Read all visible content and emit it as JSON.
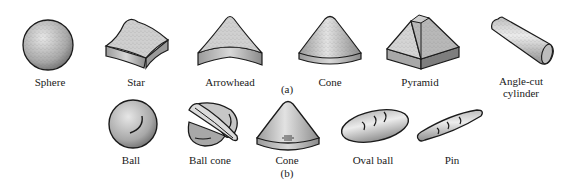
{
  "figure": {
    "row_a": {
      "caption": "(a)",
      "items": [
        {
          "name": "sphere",
          "label": "Sphere"
        },
        {
          "name": "star",
          "label": "Star"
        },
        {
          "name": "arrowhead",
          "label": "Arrowhead"
        },
        {
          "name": "cone",
          "label": "Cone"
        },
        {
          "name": "pyramid",
          "label": "Pyramid"
        },
        {
          "name": "angle-cut-cylinder",
          "label_line1": "Angle-cut",
          "label_line2": "cylinder"
        }
      ]
    },
    "row_b": {
      "caption": "(b)",
      "items": [
        {
          "name": "ball",
          "label": "Ball"
        },
        {
          "name": "ball-cone",
          "label": "Ball cone"
        },
        {
          "name": "cone",
          "label": "Cone"
        },
        {
          "name": "oval-ball",
          "label": "Oval ball"
        },
        {
          "name": "pin",
          "label": "Pin"
        }
      ]
    }
  },
  "colors": {
    "outline": "#1a1a1a",
    "fill_light": "#d9d9d9",
    "fill_dark": "#8a8a8a",
    "background": "#ffffff"
  }
}
